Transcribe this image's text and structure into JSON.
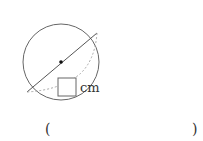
{
  "figure": {
    "unit_label": "cm",
    "stroke_color": "#555555",
    "dotted_color": "#aaaaaa"
  },
  "answer": {
    "open_paren": "(",
    "close_paren": ")",
    "value": ""
  }
}
